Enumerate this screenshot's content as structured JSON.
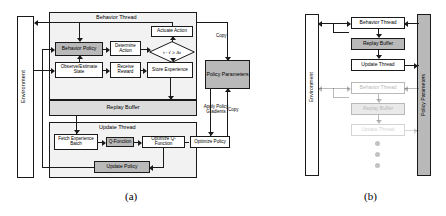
{
  "figure": {
    "panels": [
      {
        "id": "a",
        "caption": "(a)",
        "environment_label": "Environment",
        "threads": {
          "behavior_thread_title": "Behavior Thread",
          "update_thread_title": "Update Thread"
        },
        "nodes": {
          "behavior_policy": "Behavior Policy",
          "determine_action": "Determine Action",
          "actuate_action": "Actuate Action",
          "decision": "t - t' ≥ Δt",
          "observe_estimate_state": "Observe/Estimate State",
          "receive_reward": "Receive Reward",
          "store_experience": "Store Experience",
          "replay_buffer": "Replay Buffer",
          "fetch_experience_batch": "Fetch Experience Batch",
          "q_function": "Q-Function",
          "optimize_q_function": "Optimize Q-Function",
          "optimize_policy": "Optimize Policy",
          "update_policy": "Update Policy",
          "policy_parameters": "Policy Parameters"
        },
        "edge_labels": {
          "copy_top": "Copy",
          "copy_mid": "Copy",
          "apply_policy_gradients": "Apply Policy Gradients"
        }
      },
      {
        "id": "b",
        "caption": "(b)",
        "environment_label": "Environment",
        "policy_parameters_label": "Policy Parameters",
        "stacks": [
          {
            "opacity": "full",
            "behavior_thread": "Behavior Thread",
            "replay_buffer": "Replay Buffer",
            "update_thread": "Update Thread"
          },
          {
            "opacity": "faded",
            "behavior_thread": "Behavior Thread",
            "replay_buffer": "Replay Buffer",
            "update_thread": "Update Thread"
          }
        ],
        "ellipsis_dots": 3
      }
    ]
  },
  "colors": {
    "stroke": "#1a1a1a",
    "fill_grey": "#b9b9b9",
    "fill_light": "#dcdcdc",
    "panel_bg": "#f2f2f2",
    "dot": "#c2c2c2"
  }
}
